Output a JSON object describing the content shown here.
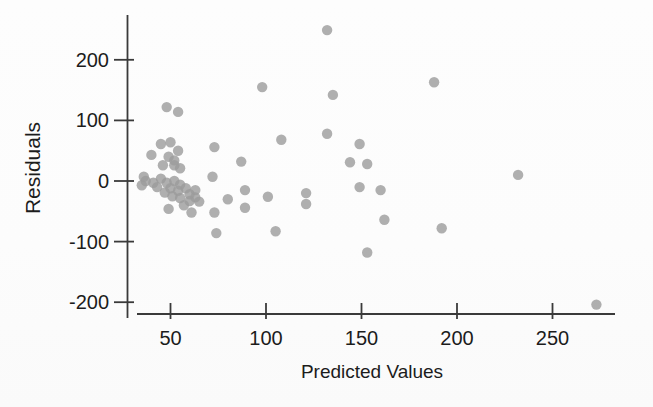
{
  "figure": {
    "background": "#fdfdfd",
    "point_color": "#9b9b9b",
    "point_opacity": 0.8,
    "axis_color": "#3a3a3a",
    "text_color": "#1c1c1c"
  },
  "chart_data": {
    "type": "scatter",
    "title": "",
    "xlabel": "Predicted Values",
    "ylabel": "Residuals",
    "x_ticks": [
      50,
      100,
      150,
      200,
      250
    ],
    "y_ticks": [
      -200,
      -100,
      0,
      100,
      200
    ],
    "xlim": [
      28,
      285
    ],
    "ylim": [
      -225,
      270
    ],
    "grid": false,
    "legend": null,
    "points": [
      [
        132,
        249
      ],
      [
        98,
        155
      ],
      [
        135,
        142
      ],
      [
        188,
        163
      ],
      [
        132,
        78
      ],
      [
        108,
        68
      ],
      [
        149,
        61
      ],
      [
        144,
        31
      ],
      [
        153,
        28
      ],
      [
        149,
        -10
      ],
      [
        160,
        -15
      ],
      [
        162,
        -64
      ],
      [
        192,
        -78
      ],
      [
        153,
        -118
      ],
      [
        232,
        10
      ],
      [
        273,
        -204
      ],
      [
        105,
        -83
      ],
      [
        121,
        -20
      ],
      [
        121,
        -38
      ],
      [
        101,
        -26
      ],
      [
        89,
        -15
      ],
      [
        89,
        -44
      ],
      [
        87,
        32
      ],
      [
        80,
        -30
      ],
      [
        73,
        -52
      ],
      [
        74,
        -86
      ],
      [
        72,
        7
      ],
      [
        73,
        56
      ],
      [
        48,
        122
      ],
      [
        54,
        114
      ],
      [
        45,
        61
      ],
      [
        50,
        64
      ],
      [
        54,
        50
      ],
      [
        40,
        43
      ],
      [
        49,
        40
      ],
      [
        52,
        34
      ],
      [
        46,
        26
      ],
      [
        52,
        26
      ],
      [
        55,
        21
      ],
      [
        36,
        7
      ],
      [
        45,
        4
      ],
      [
        37,
        0
      ],
      [
        41,
        -3
      ],
      [
        35,
        -7
      ],
      [
        43,
        -10
      ],
      [
        48,
        -3
      ],
      [
        52,
        0
      ],
      [
        55,
        -6
      ],
      [
        50,
        -12
      ],
      [
        54,
        -16
      ],
      [
        47,
        -19
      ],
      [
        51,
        -25
      ],
      [
        55,
        -28
      ],
      [
        58,
        -12
      ],
      [
        60,
        -22
      ],
      [
        63,
        -15
      ],
      [
        63,
        -27
      ],
      [
        60,
        -33
      ],
      [
        65,
        -34
      ],
      [
        57,
        -40
      ],
      [
        49,
        -46
      ],
      [
        61,
        -52
      ]
    ]
  }
}
